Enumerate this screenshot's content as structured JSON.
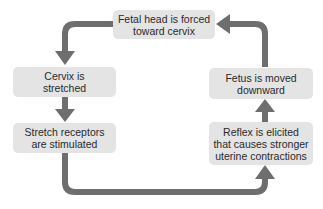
{
  "diagram": {
    "type": "positive feedback loop",
    "colors": {
      "box_fill": "#e4e4e4",
      "arrow": "#6e6e6e",
      "text": "#2a2a2a"
    },
    "nodes": [
      {
        "id": "fetal-head",
        "lines": [
          "Fetal head is forced",
          "toward cervix"
        ]
      },
      {
        "id": "cervix",
        "lines": [
          "Cervix is",
          "stretched"
        ]
      },
      {
        "id": "receptors",
        "lines": [
          "Stretch receptors",
          "are stimulated"
        ]
      },
      {
        "id": "reflex",
        "lines": [
          "Reflex is elicited",
          "that causes stronger",
          "uterine contractions"
        ]
      },
      {
        "id": "fetus",
        "lines": [
          "Fetus is moved",
          "downward"
        ]
      }
    ],
    "edges": [
      {
        "from": "fetal-head",
        "to": "cervix"
      },
      {
        "from": "cervix",
        "to": "receptors"
      },
      {
        "from": "receptors",
        "to": "reflex"
      },
      {
        "from": "reflex",
        "to": "fetus"
      },
      {
        "from": "fetus",
        "to": "fetal-head"
      }
    ]
  }
}
